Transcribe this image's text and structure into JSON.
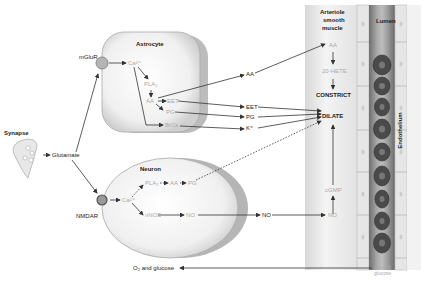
{
  "diagram": {
    "synapse": {
      "label": "Synapse",
      "output": "Glutamate"
    },
    "receptors": {
      "astrocyte": "mGluR",
      "neuron": "NMDAR"
    },
    "astrocyte": {
      "label": "Astrocyte",
      "nodes": {
        "ca": "Ca²⁺",
        "pla2": "PLA₂",
        "aa": "AA",
        "eet": "EET",
        "pg": "PG",
        "bk": "BKCa"
      }
    },
    "neuron": {
      "label": "Neuron",
      "nodes": {
        "ca": "Ca²⁺",
        "pla2": "PLA₂",
        "aa": "AA",
        "pg": "PG",
        "nnos": "nNOS",
        "no": "NO"
      }
    },
    "middle": {
      "aa": "AA",
      "eet": "EET",
      "pg": "PG",
      "k": "K⁺",
      "no": "NO"
    },
    "smooth_muscle": {
      "label_lines": [
        "Arteriole",
        "smooth",
        "muscle"
      ],
      "aa": "AA",
      "hete": "20-HETE",
      "constrict": "CONSTRICT",
      "dilate": "DILATE",
      "cgmp": "cGMP",
      "no": "NO"
    },
    "lumen": {
      "label": "Lumen",
      "endothelium": "Endothelium",
      "o2_lines": [
        "O₂ and",
        "glucose"
      ]
    },
    "bottom": {
      "o2_glucose": "O₂ and glucose"
    },
    "colors": {
      "arrow": "#333333",
      "cell_fill": "#ededed",
      "cell_shadow": "#b8b8b8",
      "vessel_wall": "#dcdcdc",
      "lumen": "#8a8a8a",
      "rbc": "#555555"
    }
  }
}
